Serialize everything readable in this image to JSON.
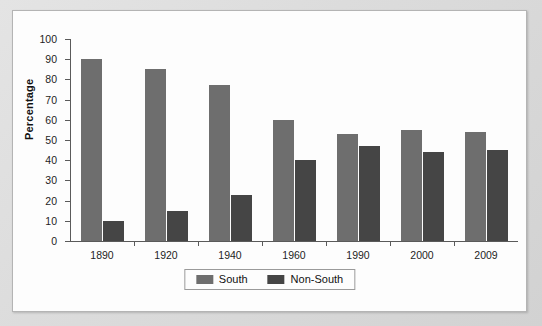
{
  "chart_data": {
    "type": "bar",
    "title": "",
    "xlabel": "",
    "ylabel": "Percentage",
    "ylim": [
      0,
      100
    ],
    "ytick_step": 10,
    "yticks": [
      0,
      10,
      20,
      30,
      40,
      50,
      60,
      70,
      80,
      90,
      100
    ],
    "grid": false,
    "legend_position": "bottom-center",
    "categories": [
      "1890",
      "1920",
      "1940",
      "1960",
      "1990",
      "2000",
      "2009"
    ],
    "series": [
      {
        "name": "South",
        "color": "#6e6e6e",
        "values": [
          90,
          85,
          77,
          60,
          53,
          55,
          54
        ]
      },
      {
        "name": "Non-South",
        "color": "#454545",
        "values": [
          10,
          15,
          23,
          40,
          47,
          44,
          45
        ]
      }
    ]
  },
  "legend": {
    "items": [
      {
        "label": "South"
      },
      {
        "label": "Non-South"
      }
    ]
  }
}
